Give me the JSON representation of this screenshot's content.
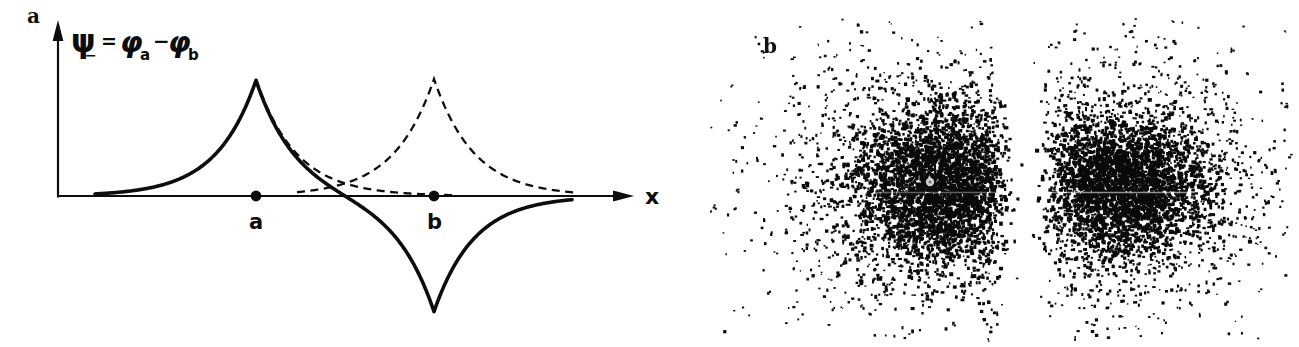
{
  "figure": {
    "panel_a_label": "a",
    "panel_b_label": "b"
  },
  "plot": {
    "formula": {
      "psi": "ψ",
      "psi_sub": "−",
      "equals": "=",
      "phi_a": "φ",
      "phi_a_sub": "a",
      "minus": "−",
      "phi_b": "φ",
      "phi_b_sub": "b"
    },
    "x_axis_label": "x",
    "nucleus_a_label": "a",
    "nucleus_b_label": "b",
    "ink_color": "#0d0d0d"
  },
  "chart_data": [
    {
      "type": "line",
      "panel": "a",
      "title": "Antisymmetric molecular orbital psi_minus = phi_a - phi_b",
      "xlabel": "x",
      "axis": {
        "origin_x": 58,
        "axis_y": 196,
        "x_arrow_tip": 634,
        "x_line_end": 616,
        "y_arrow_tip": 20,
        "y_line_top": 38
      },
      "nuclei": [
        {
          "label": "a",
          "x": 256,
          "dot_radius": 5.4
        },
        {
          "label": "b",
          "x": 434,
          "dot_radius": 5.4
        }
      ],
      "amplitude": 117,
      "decay_lambda": 40,
      "curves": [
        {
          "name": "psi_minus",
          "style": "solid",
          "formula": "A*(exp(-|x-a|/L) - exp(-|x-b|/L))",
          "x_range": [
            95,
            572
          ],
          "stroke_width": 3.6
        },
        {
          "name": "phi_a",
          "style": "dashed",
          "formula": "A*exp(-|x-a|/L)",
          "x_range": [
            256,
            452
          ],
          "stroke_width": 2.3
        },
        {
          "name": "phi_b",
          "style": "dashed",
          "formula": "A*exp(-|x-b|/L)",
          "x_range": [
            297,
            576
          ],
          "stroke_width": 2.3
        }
      ],
      "dash_pattern": "8 5.5"
    },
    {
      "type": "scatter",
      "panel": "b",
      "title": "Dot-density picture of |psi_minus|^2 with nodal plane between nuclei",
      "clusters": [
        {
          "name": "cloud-a",
          "center_x": 250,
          "center_y": 185,
          "n": 4500,
          "weights": [
            0.55,
            0.33,
            0.12
          ],
          "sigmas": [
            [
              42,
              38
            ],
            [
              75,
              62
            ],
            [
              110,
              88
            ]
          ],
          "dot_sizes": [
            [
              2.0,
              4.2
            ],
            [
              1.8,
              3.4
            ],
            [
              1.3,
              2.6
            ]
          ]
        },
        {
          "name": "cloud-b",
          "center_x": 430,
          "center_y": 186,
          "n": 4200,
          "weights": [
            0.55,
            0.33,
            0.12
          ],
          "sigmas": [
            [
              42,
              34
            ],
            [
              70,
              58
            ],
            [
              105,
              82
            ]
          ],
          "dot_sizes": [
            [
              2.0,
              4.2
            ],
            [
              1.8,
              3.4
            ],
            [
              1.3,
              2.6
            ]
          ]
        }
      ],
      "node": {
        "x": 336,
        "halfwidth": 40,
        "exponent": 2
      },
      "bounds": {
        "y_min": 18,
        "y_max": 340,
        "x_min": 20,
        "x_max": 600
      },
      "seed": 20240817,
      "dot_color": "#0a0a0a",
      "artifacts": {
        "scan_lines": [
          {
            "y": 192,
            "x0": 185,
            "x1": 310,
            "alpha": 0.35
          },
          {
            "y": 192,
            "x0": 325,
            "x1": 505,
            "alpha": 0.55
          }
        ],
        "bright_spot": {
          "x": 240,
          "y": 182,
          "radius": 4.2
        }
      }
    }
  ]
}
